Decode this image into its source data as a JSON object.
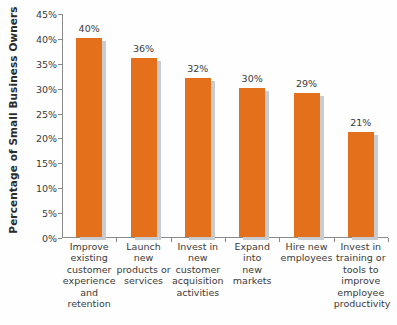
{
  "chart_data": {
    "type": "bar",
    "title": "",
    "xlabel": "",
    "ylabel": "Percentage of Small Business Owners",
    "ylim": [
      0,
      45
    ],
    "ytick_labels": [
      "45%",
      "40%",
      "35%",
      "30%",
      "25%",
      "20%",
      "15%",
      "10%",
      "5%",
      "0%"
    ],
    "ytick_values": [
      45,
      40,
      35,
      30,
      25,
      20,
      15,
      10,
      5,
      0
    ],
    "grid": false,
    "legend": "none",
    "categories": [
      "Improve existing customer experience and retention",
      "Launch new products or services",
      "Invest in new customer acquisition activities",
      "Expand into new markets",
      "Hire new employees",
      "Invest in training or tools to improve employee productivity"
    ],
    "category_lines": [
      [
        "Improve",
        "existing",
        "customer",
        "experience",
        "and",
        "retention"
      ],
      [
        "Launch new",
        "products or",
        "services"
      ],
      [
        "Invest in",
        "new",
        "customer",
        "acquisition",
        "activities"
      ],
      [
        "Expand",
        "into",
        "new",
        "markets"
      ],
      [
        "Hire new",
        "employees"
      ],
      [
        "Invest in",
        "training or",
        "tools to",
        "improve",
        "employee",
        "productivity"
      ]
    ],
    "values": [
      40,
      36,
      32,
      30,
      29,
      21
    ],
    "value_labels": [
      "40%",
      "36%",
      "32%",
      "30%",
      "29%",
      "21%"
    ],
    "bar_color": "#e5701b",
    "bar_shadow_color": "#c7ccd1",
    "axis_color": "#8a8a8a",
    "text_color": "#3a3a3a",
    "background_color": "#fefefe"
  }
}
